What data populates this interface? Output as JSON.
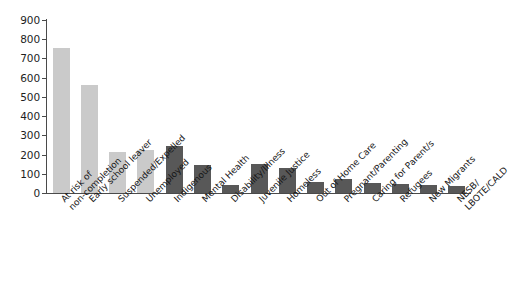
{
  "chart_data": {
    "type": "bar",
    "title": "",
    "subtitle": "",
    "xlabel": "",
    "ylabel": "",
    "ylim": [
      0,
      900
    ],
    "grid": false,
    "legend": "none",
    "y_ticks": [
      0,
      100,
      200,
      300,
      400,
      500,
      600,
      700,
      800,
      900
    ],
    "categories": [
      "At risk of\nnon-completion",
      "Early school leaver",
      "Suspended/Expelled",
      "Unemployed",
      "Indigenous",
      "Mental Health",
      "Disability/Illness",
      "Juvenile Justice",
      "Homeless",
      "Out of Home Care",
      "Pregnant/Parenting",
      "Caring for Parent/s",
      "Refugees",
      "New Migrants",
      "NESB/\nLBOTE/CALD"
    ],
    "values": [
      755,
      560,
      215,
      225,
      245,
      145,
      40,
      150,
      130,
      55,
      75,
      50,
      45,
      42,
      38
    ],
    "bar_colors": [
      "#cacaca",
      "#cacaca",
      "#cacaca",
      "#cacaca",
      "#585858",
      "#585858",
      "#585858",
      "#585858",
      "#585858",
      "#585858",
      "#585858",
      "#585858",
      "#585858",
      "#585858",
      "#585858"
    ],
    "colors": {
      "light_bar": "#cacaca",
      "dark_bar": "#585858",
      "axis": "#4a4a4a",
      "text": "#161616",
      "background": "#ffffff"
    }
  }
}
